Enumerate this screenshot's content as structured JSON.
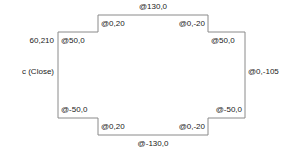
{
  "diagram": {
    "type": "relative-coordinate-polyline",
    "stroke_color": "#8a8a8a",
    "text_color": "#1a1a1a",
    "background_color": "#ffffff",
    "start_point_label": "60,210",
    "close_label": "c (Close)",
    "segments": [
      {
        "id": "seg-top-left-horizontal",
        "label": "@50,0"
      },
      {
        "id": "seg-left-step-up",
        "label": "@0,20"
      },
      {
        "id": "seg-top-horizontal",
        "label": "@130,0"
      },
      {
        "id": "seg-right-step-down",
        "label": "@0,-20"
      },
      {
        "id": "seg-top-right-horizontal",
        "label": "@50,0"
      },
      {
        "id": "seg-right-vertical",
        "label": "@0,-105"
      },
      {
        "id": "seg-bottom-right-horizontal",
        "label": "@-50,0"
      },
      {
        "id": "seg-right-step-up",
        "label": "@0,-20"
      },
      {
        "id": "seg-bottom-horizontal",
        "label": "@-130,0"
      },
      {
        "id": "seg-left-step-down",
        "label": "@0,20"
      },
      {
        "id": "seg-bottom-left-horizontal",
        "label": "@-50,0"
      },
      {
        "id": "seg-left-vertical-close",
        "label": "c (Close)"
      }
    ],
    "labels": {
      "start_point": "60,210",
      "top_left_h": "@50,0",
      "top_left_step": "@0,20",
      "top_h": "@130,0",
      "top_right_step": "@0,-20",
      "top_right_h": "@50,0",
      "right_v": "@0,-105",
      "bottom_right_h": "@-50,0",
      "bottom_right_step": "@0,-20",
      "bottom_h": "@-130,0",
      "bottom_left_step": "@0,20",
      "bottom_left_h": "@-50,0",
      "close": "c (Close)"
    },
    "geometry": {
      "outline_path": "M 58 32 L 98 32 L 98 15 L 208 15 L 208 32 L 245 32 L 245 118 L 208 118 L 208 135 L 98 135 L 98 118 L 58 118 Z"
    }
  }
}
